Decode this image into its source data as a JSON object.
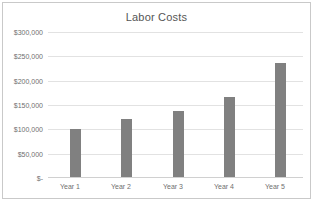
{
  "chart_data": {
    "type": "bar",
    "title": "Labor Costs",
    "xlabel": "",
    "ylabel": "",
    "categories": [
      "Year 1",
      "Year 2",
      "Year 3",
      "Year 4",
      "Year 5"
    ],
    "values": [
      100000,
      120000,
      137000,
      165000,
      235000
    ],
    "series": [
      {
        "name": "Labor Costs",
        "values": [
          100000,
          120000,
          137000,
          165000,
          235000
        ]
      }
    ],
    "ylim": [
      0,
      300000
    ],
    "ytick_values": [
      300000,
      250000,
      200000,
      150000,
      100000,
      50000,
      0
    ],
    "ytick_labels": [
      "$300,000",
      "$250,000",
      "$200,000",
      "$150,000",
      "$100,000",
      "$50,000",
      "$-"
    ],
    "grid": true,
    "legend": false,
    "legend_position": "none",
    "bar_color": "#808080",
    "gridline_color": "#e2e2e2",
    "text_color": "#6f6f6f",
    "title_color": "#555555",
    "border_color": "#c9c9c9",
    "background_color": "#ffffff"
  }
}
